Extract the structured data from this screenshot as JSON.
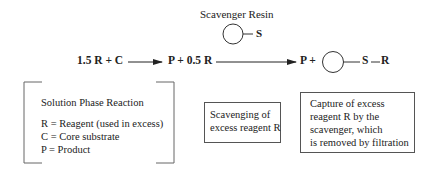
{
  "resin_label": "Scavenger Resin",
  "resin_symbol": "S",
  "reaction": {
    "reactants": "1.5 R + C",
    "intermediate": "P + 0.5 R",
    "product_p": "P +",
    "product_s": "S",
    "product_r": "R"
  },
  "solution_box": {
    "title": "Solution Phase Reaction",
    "lines": [
      "R = Reagent (used in excess)",
      "C = Core substrate",
      "P = Product"
    ]
  },
  "scavenging_box": {
    "lines": [
      "Scavenging of",
      "excess reagent R"
    ]
  },
  "capture_box": {
    "lines": [
      "Capture of excess",
      "reagent R by the",
      "scavenger, which",
      "is removed by filtration"
    ]
  },
  "colors": {
    "line": "#333333",
    "text": "#222222",
    "box_border": "#555555"
  }
}
